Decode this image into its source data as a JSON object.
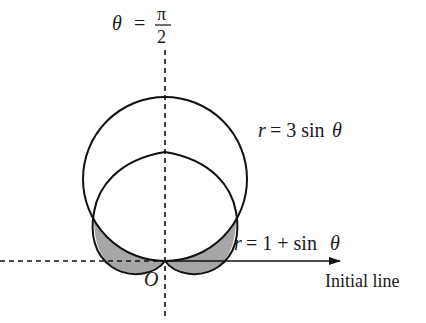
{
  "diagram": {
    "type": "polar-curves",
    "origin_label": "O",
    "vertical_axis_label": {
      "lhs": "θ",
      "eq": "=",
      "numerator": "π",
      "denominator": "2"
    },
    "initial_line_label": "Initial line",
    "curves": [
      {
        "name": "circle",
        "label_lhs": "r",
        "label_rhs": "= 3 sin",
        "label_var": "θ",
        "equation": "r = 3 sin θ"
      },
      {
        "name": "cardioid",
        "label_lhs": "r",
        "label_rhs": "= 1 + sin",
        "label_var": "θ",
        "equation": "r = 1 + sin θ"
      }
    ],
    "intersections": [
      "θ = π/6",
      "θ = 5π/6"
    ],
    "shaded_region": "region inside r = 1 + sin θ and outside r = 3 sin θ",
    "colors": {
      "stroke": "#111111",
      "shade": "#a6a6a6",
      "background": "#ffffff"
    }
  }
}
